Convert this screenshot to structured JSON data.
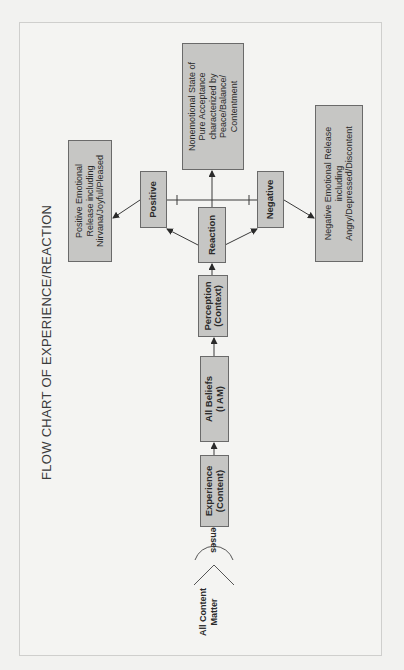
{
  "title": "FLOW CHART OF EXPERIENCE/REACTION",
  "colors": {
    "background": "#f2f2f0",
    "box_fill": "#c6c6c4",
    "box_border": "#6a6a6a",
    "line": "#3a3a3a",
    "text": "#2a2a2a"
  },
  "source": {
    "label": "All Content Matter",
    "line1": "All Content",
    "line2": "Matter"
  },
  "senses_label": "Senses",
  "nodes": {
    "experience": {
      "line1": "Experience",
      "line2": "(Content)"
    },
    "beliefs": {
      "line1": "All Beliefs",
      "line2": "(I AM)"
    },
    "perception": {
      "line1": "Perception",
      "line2": "(Context)"
    },
    "reaction": {
      "line1": "Reaction"
    },
    "positive": {
      "line1": "Positive"
    },
    "negative": {
      "line1": "Negative"
    },
    "nonemotional": {
      "line1": "Nonemotional State of",
      "line2": "Pure Acceptance",
      "line3": "characterized by",
      "line4": "Peace/Balance/",
      "line5": "Contentment"
    },
    "positive_release": {
      "line1": "Positive Emotional",
      "line2": "Release including",
      "line3": "Nirvana/Joyful/Pleased"
    },
    "negative_release": {
      "line1": "Negative Emotional Release",
      "line2": "including",
      "line3": "Angry/Depressed/Discontent"
    }
  },
  "flow": [
    "All Content Matter",
    "Senses",
    "Experience (Content)",
    "All Beliefs (I AM)",
    "Perception (Context)",
    "Reaction",
    [
      "Positive",
      "Nonemotional State",
      "Negative"
    ],
    [
      "Positive Emotional Release",
      "Negative Emotional Release"
    ]
  ]
}
